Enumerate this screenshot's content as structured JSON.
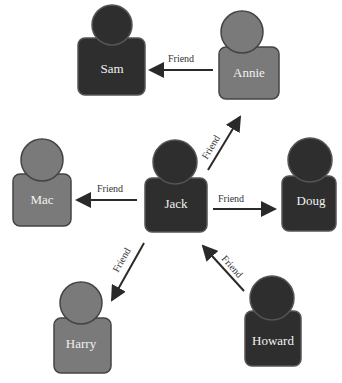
{
  "diagram": {
    "type": "social-graph",
    "colors": {
      "dark_person": "#2e2e2e",
      "light_person": "#7a7a7a",
      "outline": "#555555",
      "arrow": "#2a2a2a",
      "background": "#ffffff"
    },
    "nodes": [
      {
        "id": "sam",
        "label": "Sam",
        "shade": "dark"
      },
      {
        "id": "annie",
        "label": "Annie",
        "shade": "light"
      },
      {
        "id": "mac",
        "label": "Mac",
        "shade": "light"
      },
      {
        "id": "jack",
        "label": "Jack",
        "shade": "dark"
      },
      {
        "id": "doug",
        "label": "Doug",
        "shade": "dark"
      },
      {
        "id": "harry",
        "label": "Harry",
        "shade": "light"
      },
      {
        "id": "howard",
        "label": "Howard",
        "shade": "dark"
      }
    ],
    "edges": [
      {
        "from": "annie",
        "to": "sam",
        "label": "Friend"
      },
      {
        "from": "jack",
        "to": "annie",
        "label": "Friend"
      },
      {
        "from": "jack",
        "to": "mac",
        "label": "Friend"
      },
      {
        "from": "jack",
        "to": "doug",
        "label": "Friend"
      },
      {
        "from": "jack",
        "to": "harry",
        "label": "Friend"
      },
      {
        "from": "howard",
        "to": "jack",
        "label": "Friend"
      }
    ]
  }
}
